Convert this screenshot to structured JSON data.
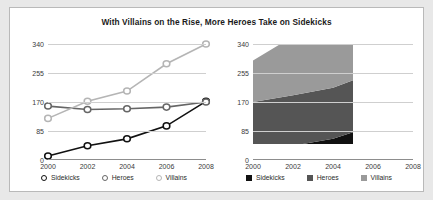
{
  "title": "With Villains on the Rise, More Heroes Take on Sidekicks",
  "colors": {
    "sidekicks": "#111111",
    "heroes": "#666666",
    "villains": "#b5b5b5",
    "grid": "#cfcfcf",
    "axis": "#8d8d8d",
    "panel_background": "#ffffff",
    "page_background": "#e8e8e8",
    "text": "#1b1b1b"
  },
  "charts": [
    {
      "id": "line-chart",
      "legend": [
        {
          "label": "Sidekicks",
          "color": "#111111",
          "marker": "circle"
        },
        {
          "label": "Heroes",
          "color": "#666666",
          "marker": "circle"
        },
        {
          "label": "Villains",
          "color": "#b5b5b5",
          "marker": "circle"
        }
      ]
    },
    {
      "id": "stacked-area-chart",
      "legend": [
        {
          "label": "Sidekicks",
          "color": "#111111",
          "marker": "square"
        },
        {
          "label": "Heroes",
          "color": "#555555",
          "marker": "square"
        },
        {
          "label": "Villains",
          "color": "#9a9a9a",
          "marker": "square"
        }
      ]
    }
  ],
  "chart_data": [
    {
      "type": "line",
      "title": "With Villains on the Rise, More Heroes Take on Sidekicks",
      "x": [
        2000,
        2002,
        2004,
        2006,
        2008
      ],
      "xticklabels": [
        "2000",
        "2002",
        "2004",
        "2006",
        "2008"
      ],
      "yticks": [
        0,
        85,
        170,
        255,
        340
      ],
      "ylim": [
        0,
        340
      ],
      "xlabel": "",
      "ylabel": "",
      "grid": true,
      "legend_position": "bottom",
      "markers": "open-circle",
      "series": [
        {
          "name": "Sidekicks",
          "color": "#111111",
          "values": [
            12,
            42,
            62,
            100,
            172
          ]
        },
        {
          "name": "Heroes",
          "color": "#666666",
          "values": [
            158,
            148,
            150,
            155,
            170
          ]
        },
        {
          "name": "Villains",
          "color": "#b5b5b5",
          "values": [
            122,
            172,
            202,
            282,
            340
          ]
        }
      ]
    },
    {
      "type": "area",
      "stacked": true,
      "title": "",
      "x": [
        2000,
        2002,
        2004,
        2006,
        2008
      ],
      "xticklabels": [
        "2000",
        "2002",
        "2004",
        "2006",
        "2008"
      ],
      "yticks": [
        0,
        85,
        170,
        255,
        340
      ],
      "ylim": [
        0,
        340
      ],
      "xlabel": "",
      "ylabel": "",
      "grid": true,
      "legend_position": "bottom",
      "note": "Stacked totals exceed the 340 axis maximum; upper band is clipped at the plot top.",
      "series": [
        {
          "name": "Sidekicks",
          "color": "#111111",
          "values": [
            12,
            42,
            62,
            100,
            172
          ]
        },
        {
          "name": "Heroes",
          "color": "#555555",
          "values": [
            158,
            148,
            150,
            155,
            170
          ]
        },
        {
          "name": "Villains",
          "color": "#9a9a9a",
          "values": [
            122,
            172,
            202,
            282,
            340
          ]
        }
      ]
    }
  ]
}
